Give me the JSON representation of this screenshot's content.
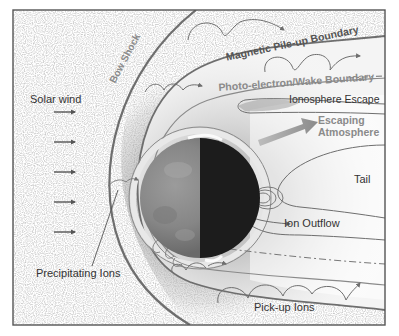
{
  "diagram": {
    "colors": {
      "frame": "#555555",
      "boundary_line": "#6e6e6e",
      "label_dark": "#333333",
      "label_gray": "#8a8a8a",
      "planet_day": "#8c8c8c",
      "planet_night": "#1c1c1c",
      "background": "#ffffff",
      "speckle": "#d9d9d9"
    },
    "labels": {
      "solar_wind": "Solar wind",
      "bow_shock": "Bow Shock",
      "magnetic_pileup": "Magnetic Pile-up Boundary",
      "photoelectron_wake": "Photo-electron/Wake Boundary",
      "ionosphere_escape": "Ionosphere Escape",
      "escaping_atmosphere_1": "Escaping",
      "escaping_atmosphere_2": "Atmosphere",
      "tail": "Tail",
      "ion_outflow": "Ion Outflow",
      "precipitating_ions": "Precipitating Ions",
      "pickup_ions": "Pick-up Ions"
    },
    "solar_wind_arrows": [
      {
        "y": 112
      },
      {
        "y": 142
      },
      {
        "y": 172
      },
      {
        "y": 202
      },
      {
        "y": 232
      }
    ],
    "planet": {
      "center_x": 200,
      "center_y": 198,
      "radius": 60,
      "dayside": "left",
      "nightside": "right"
    }
  }
}
